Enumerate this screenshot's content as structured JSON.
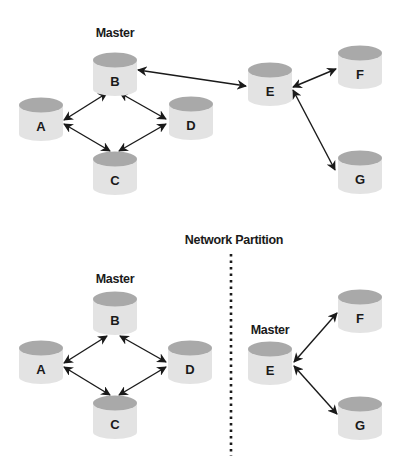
{
  "colors": {
    "cylinder_body": "#e3e3e3",
    "cylinder_top": "#a9a9a9",
    "arrow": "#1a1a1a",
    "text": "#1a1a1a",
    "background": "#ffffff"
  },
  "top_diagram": {
    "master_label": "Master",
    "nodes": [
      {
        "id": "A",
        "label": "A",
        "x": 19,
        "y": 98
      },
      {
        "id": "B",
        "label": "B",
        "x": 93,
        "y": 53
      },
      {
        "id": "C",
        "label": "C",
        "x": 93,
        "y": 152
      },
      {
        "id": "D",
        "label": "D",
        "x": 169,
        "y": 97
      },
      {
        "id": "E",
        "label": "E",
        "x": 248,
        "y": 63
      },
      {
        "id": "F",
        "label": "F",
        "x": 338,
        "y": 46
      },
      {
        "id": "G",
        "label": "G",
        "x": 338,
        "y": 151
      }
    ],
    "edges": [
      [
        "A",
        "B"
      ],
      [
        "B",
        "D"
      ],
      [
        "A",
        "C"
      ],
      [
        "C",
        "D"
      ],
      [
        "B",
        "E"
      ],
      [
        "E",
        "F"
      ],
      [
        "E",
        "G"
      ]
    ]
  },
  "partition": {
    "label": "Network Partition"
  },
  "bottom_left": {
    "master_label": "Master",
    "nodes": [
      {
        "id": "A",
        "label": "A",
        "x": 19,
        "y": 341
      },
      {
        "id": "B",
        "label": "B",
        "x": 93,
        "y": 292
      },
      {
        "id": "C",
        "label": "C",
        "x": 93,
        "y": 396
      },
      {
        "id": "D",
        "label": "D",
        "x": 168,
        "y": 341
      }
    ],
    "edges": [
      [
        "A",
        "B"
      ],
      [
        "B",
        "D"
      ],
      [
        "A",
        "C"
      ],
      [
        "C",
        "D"
      ]
    ]
  },
  "bottom_right": {
    "master_label": "Master",
    "nodes": [
      {
        "id": "E",
        "label": "E",
        "x": 248,
        "y": 342
      },
      {
        "id": "F",
        "label": "F",
        "x": 338,
        "y": 290
      },
      {
        "id": "G",
        "label": "G",
        "x": 338,
        "y": 397
      }
    ],
    "edges": [
      [
        "E",
        "F"
      ],
      [
        "E",
        "G"
      ]
    ]
  }
}
